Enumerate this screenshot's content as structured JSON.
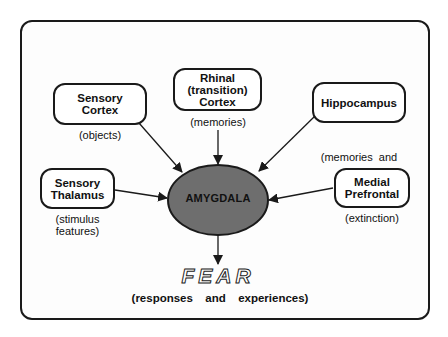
{
  "diagram": {
    "center": {
      "label": "AMYGDALA",
      "fill": "#6e6e6e"
    },
    "inputs": [
      {
        "id": "sensory-cortex",
        "label_lines": [
          "Sensory",
          "Cortex"
        ],
        "note_lines": [
          "(objects)"
        ]
      },
      {
        "id": "rhinal-cortex",
        "label_lines": [
          "Rhinal",
          "(transition)",
          "Cortex"
        ],
        "note_lines": [
          "(memories)"
        ]
      },
      {
        "id": "hippocampus",
        "label_lines": [
          "Hippocampus"
        ],
        "note_lines": [
          "(memories  and",
          "contexts)"
        ]
      },
      {
        "id": "sensory-thalamus",
        "label_lines": [
          "Sensory",
          "Thalamus"
        ],
        "note_lines": [
          "(stimulus",
          "features)"
        ]
      },
      {
        "id": "medial-prefrontal",
        "label_lines": [
          "Medial",
          "Prefrontal"
        ],
        "note_lines": [
          "(extinction)"
        ]
      }
    ],
    "output": {
      "label": "FEAR",
      "subtitle": "(responses  and  experiences)"
    },
    "colors": {
      "stroke": "#1a1a1a",
      "background": "#ffffff",
      "amygdala_fill": "#6e6e6e"
    }
  }
}
